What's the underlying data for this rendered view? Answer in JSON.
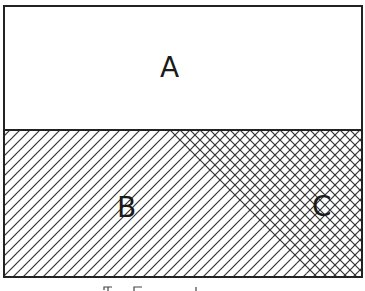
{
  "diagram": {
    "regions": [
      {
        "id": "A",
        "label": "A",
        "fill": "none"
      },
      {
        "id": "B",
        "label": "B",
        "fill": "single-hatch"
      },
      {
        "id": "C",
        "label": "C",
        "fill": "cross-hatch"
      }
    ],
    "caption": "(partially visible caption)"
  },
  "colors": {
    "stroke": "#222222",
    "background": "#ffffff"
  }
}
